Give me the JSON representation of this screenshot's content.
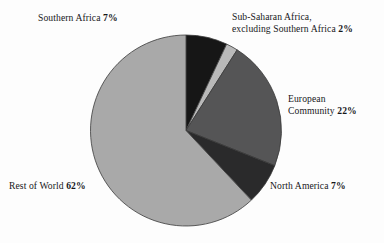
{
  "chart_data": {
    "type": "pie",
    "title": "",
    "subtitle": "",
    "xlabel": "",
    "ylabel": "",
    "legend_position": "none",
    "grid": false,
    "start_angle_deg": 0,
    "direction": "clockwise",
    "categories": [
      "Southern Africa",
      "Sub-Saharan Africa, excluding Southern Africa",
      "European Community",
      "North America",
      "Rest of World"
    ],
    "values": [
      7,
      2,
      22,
      7,
      62
    ],
    "value_unit": "%",
    "colors": [
      "#161616",
      "#b9b9b9",
      "#555556",
      "#2a2a2b",
      "#a9a9a9"
    ],
    "slices": [
      {
        "name": "Southern Africa",
        "value": 7,
        "value_text": "7%",
        "color": "#161616",
        "label_lines": [
          "Southern Africa"
        ],
        "label_position": "top-left"
      },
      {
        "name": "Sub-Saharan Africa, excluding Southern Africa",
        "value": 2,
        "value_text": "2%",
        "color": "#b9b9b9",
        "label_lines": [
          "Sub-Saharan Africa,",
          "excluding Southern Africa"
        ],
        "label_position": "top-right"
      },
      {
        "name": "European Community",
        "value": 22,
        "value_text": "22%",
        "color": "#555556",
        "label_lines": [
          "European",
          "Community"
        ],
        "label_position": "right"
      },
      {
        "name": "North America",
        "value": 7,
        "value_text": "7%",
        "color": "#2a2a2b",
        "label_lines": [
          "North America"
        ],
        "label_position": "bottom-right"
      },
      {
        "name": "Rest of World",
        "value": 62,
        "value_text": "62%",
        "color": "#a9a9a9",
        "label_lines": [
          "Rest of World"
        ],
        "label_position": "bottom-left"
      }
    ]
  },
  "labels": {
    "southern_africa": {
      "line1": "Southern Africa",
      "pct": "7%"
    },
    "subsaharan": {
      "line1": "Sub-Saharan Africa,",
      "line2": "excluding Southern Africa",
      "pct": "2%"
    },
    "european": {
      "line1": "European",
      "line2": "Community",
      "pct": "22%"
    },
    "north_america": {
      "line1": "North America",
      "pct": "7%"
    },
    "rest_of_world": {
      "line1": "Rest of World",
      "pct": "62%"
    }
  },
  "style": {
    "background": "#fdfdfd",
    "outline": "#3a3a3a",
    "text": "#17171a"
  }
}
